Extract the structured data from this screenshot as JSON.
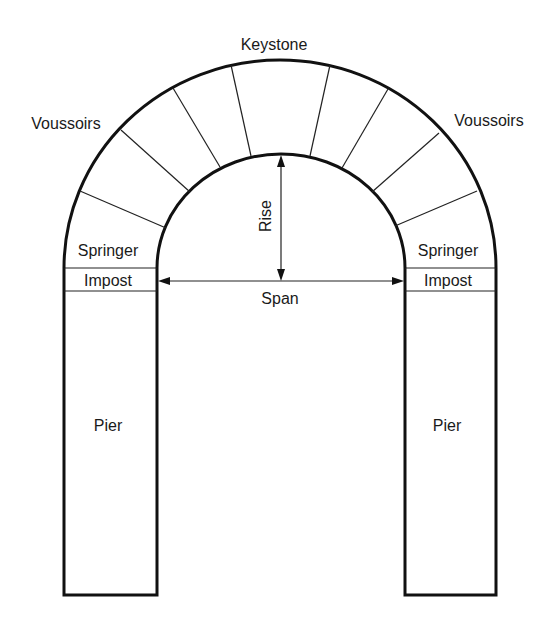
{
  "diagram": {
    "labels": {
      "keystone": "Keystone",
      "voussoirs_left": "Voussoirs",
      "voussoirs_right": "Voussoirs",
      "springer_left": "Springer",
      "springer_right": "Springer",
      "impost_left": "Impost",
      "impost_right": "Impost",
      "rise": "Rise",
      "span": "Span",
      "pier_left": "Pier",
      "pier_right": "Pier"
    },
    "colors": {
      "stroke": "#111111",
      "text": "#1a1a1a",
      "background": "#ffffff"
    }
  }
}
